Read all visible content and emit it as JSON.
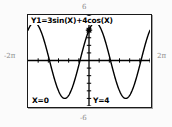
{
  "screen": {
    "device": "graphing-calculator",
    "equation_label": "Y1=3sin(X)+4cos(X)",
    "trace_x_label": "X=0",
    "trace_y_label": "Y=4",
    "colors": {
      "curve": "#000000",
      "frame": "#1a1a1a",
      "background": "#ffffff",
      "outer_background": "#fbfbfb",
      "axis_label": "#8a8a8a"
    }
  },
  "axis_labels": {
    "top": "6",
    "bottom": "-6",
    "left": "-2π",
    "right": "2π"
  },
  "chart_data": {
    "type": "line",
    "title": "Y1=3sin(X)+4cos(X)",
    "expression": "3*sin(x) + 4*cos(x)",
    "amplitude": 5,
    "xlabel": "",
    "ylabel": "",
    "xlim": [
      -6.283185307,
      6.283185307
    ],
    "ylim": [
      -6,
      6
    ],
    "xtick_labels": [
      "-2π",
      "2π"
    ],
    "ytick_labels": [
      "6",
      "-6"
    ],
    "grid": false,
    "legend": false,
    "x_tick_spacing": 1.0471975512,
    "y_tick_spacing": 1,
    "trace_cursor": {
      "x": 0,
      "y": 4,
      "label_x": "X=0",
      "label_y": "Y=4"
    },
    "x": [
      -6.2832,
      -5.8905,
      -5.4978,
      -5.1051,
      -4.7124,
      -4.3197,
      -3.927,
      -3.5343,
      -3.1416,
      -2.7489,
      -2.3562,
      -1.9635,
      -1.5708,
      -1.1781,
      -0.7854,
      -0.3927,
      0,
      0.3927,
      0.7854,
      1.1781,
      1.5708,
      1.9635,
      2.3562,
      2.7489,
      3.1416,
      3.5343,
      3.927,
      4.3197,
      4.7124,
      5.1051,
      5.4978,
      5.8905,
      6.2832
    ],
    "y": [
      4,
      4.97,
      4.95,
      3.95,
      2.12,
      -0.22,
      -2.58,
      -4.37,
      -4,
      -4.97,
      -4.95,
      -3.95,
      -2.12,
      0.22,
      2.58,
      4.37,
      4,
      4.97,
      4.95,
      3.95,
      2.12,
      -0.22,
      -2.58,
      -4.37,
      -4,
      -4.97,
      -4.95,
      -3.95,
      -2.12,
      0.22,
      2.58,
      4.37,
      4
    ]
  }
}
